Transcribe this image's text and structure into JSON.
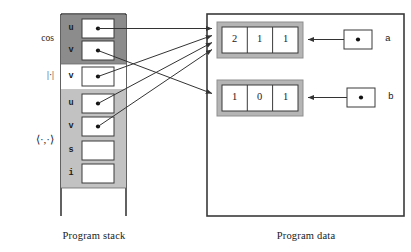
{
  "diagram": {
    "captions": {
      "stack": "Program stack",
      "data": "Program data"
    },
    "stack": {
      "frames": [
        {
          "label": "cos",
          "shade": "#8c8c8c",
          "cells": [
            {
              "var": "u",
              "pointer": true
            },
            {
              "var": "v",
              "pointer": true
            }
          ]
        },
        {
          "label": "|·|",
          "shade": "#ffffff",
          "cells": [
            {
              "var": "v",
              "pointer": true
            }
          ]
        },
        {
          "label": "⟨·,·⟩",
          "shade": "#c2c2c2",
          "cells": [
            {
              "var": "u",
              "pointer": true
            },
            {
              "var": "v",
              "pointer": true
            },
            {
              "var": "s",
              "pointer": false
            },
            {
              "var": "i",
              "pointer": false
            }
          ]
        }
      ]
    },
    "data": {
      "arrays": [
        {
          "name": "a",
          "values": [
            "2",
            "1",
            "1"
          ]
        },
        {
          "name": "b",
          "values": [
            "1",
            "0",
            "1"
          ]
        }
      ]
    },
    "edges": [
      {
        "from": "cos.u",
        "to": "a"
      },
      {
        "from": "cos.v",
        "to": "a"
      },
      {
        "from": "abs.v",
        "to": "b"
      },
      {
        "from": "inner.u",
        "to": "a"
      },
      {
        "from": "inner.v",
        "to": "a"
      },
      {
        "from": "ptr_a",
        "to": "a"
      },
      {
        "from": "ptr_b",
        "to": "b"
      }
    ],
    "colors": {
      "line": "#333333",
      "arrayborder": "#a8a8a8",
      "boxline": "#3a3a3a"
    }
  }
}
